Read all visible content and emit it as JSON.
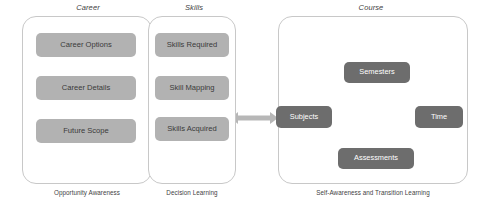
{
  "diagram": {
    "panels": [
      {
        "id": "career",
        "title": "Career",
        "caption": "Opportunity Awareness",
        "nodes": [
          {
            "id": "career-options",
            "label": "Career Options"
          },
          {
            "id": "career-details",
            "label": "Career Details"
          },
          {
            "id": "future-scope",
            "label": "Future Scope"
          }
        ]
      },
      {
        "id": "skills",
        "title": "Skills",
        "caption": "Decision Learning",
        "nodes": [
          {
            "id": "skills-required",
            "label": "Skills Required"
          },
          {
            "id": "skill-mapping",
            "label": "Skill Mapping"
          },
          {
            "id": "skills-acquired",
            "label": "Skills Acquired"
          }
        ]
      },
      {
        "id": "course",
        "title": "Course",
        "caption": "Self-Awareness and Transition Learning",
        "nodes": [
          {
            "id": "semesters",
            "label": "Semesters"
          },
          {
            "id": "subjects",
            "label": "Subjects"
          },
          {
            "id": "time",
            "label": "Time"
          },
          {
            "id": "assessments",
            "label": "Assessments"
          },
          {
            "id": "study-plan",
            "label": "Study\nPlan"
          }
        ]
      }
    ],
    "connectors": [
      {
        "id": "career-options-to-career-details",
        "from": "Career Options",
        "to": "Career Details",
        "direction": "down"
      },
      {
        "id": "career-details-to-future-scope",
        "from": "Career Details",
        "to": "Future Scope",
        "direction": "down"
      },
      {
        "id": "skills-required-to-skill-mapping",
        "from": "Skills Required",
        "to": "Skill Mapping",
        "direction": "down"
      },
      {
        "id": "skills-acquired-to-skill-mapping",
        "from": "Skills Acquired",
        "to": "Skill Mapping",
        "direction": "up"
      },
      {
        "id": "career-options-to-skills-required",
        "from": "Career Options",
        "to": "Skills Required",
        "direction": "bidirectional"
      },
      {
        "id": "skills-acquired-to-subjects",
        "from": "Skills Acquired",
        "to": "Subjects",
        "direction": "bidirectional"
      },
      {
        "id": "study-plan-hub",
        "from": "Study Plan",
        "to": "Semesters, Subjects, Time, Assessments",
        "direction": "four-way"
      }
    ],
    "colors": {
      "light_node": "#b2b2b2",
      "dark_node": "#6d6d6d",
      "panel_border": "#c8c8c8",
      "arrow": "#b7b7b7",
      "arrow_dark": "#6d6d6d",
      "text": "#3f3f3f",
      "text_on_dark": "#ffffff",
      "background": "#ffffff"
    }
  }
}
